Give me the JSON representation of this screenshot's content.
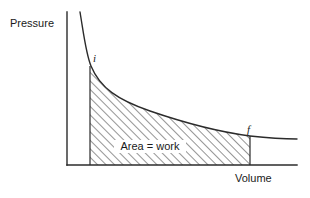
{
  "figure": {
    "type": "pv-diagram",
    "background_color": "#ffffff",
    "ink_color": "#2b2b2b",
    "axes": {
      "y_axis_label": "Pressure",
      "x_axis_label": "Volume",
      "y_axis": {
        "x": 67,
        "y_top": 12,
        "y_bottom": 165
      },
      "x_axis": {
        "y": 165,
        "x_left": 67,
        "x_right": 297
      }
    },
    "curve": {
      "name": "isotherm",
      "description": "hyperbolic pressure-volume curve",
      "path": "M 80 12 C 84 36, 86 54, 91 66 C 100 88, 118 100, 150 111 C 182 122, 220 132, 250 136 C 268 138, 285 139, 297 139"
    },
    "shaded_region": {
      "label": "Area = work",
      "left_boundary_x": 90,
      "right_boundary_x": 250,
      "baseline_y": 165,
      "hatch_angle_deg": 45,
      "hatch_spacing_px": 6,
      "fill_path": "M 90 66 C 100 88, 118 100, 150 111 C 182 122, 220 132, 250 136 L 250 165 L 90 165 Z",
      "label_x": 150,
      "label_y": 150
    },
    "points": [
      {
        "id": "i",
        "label": "i",
        "label_x": 93,
        "label_y": 62,
        "marker_x": 90,
        "marker_y": 66
      },
      {
        "id": "f",
        "label": "f",
        "label_x": 247,
        "label_y": 133,
        "marker_x": 250,
        "marker_y": 136
      }
    ]
  }
}
